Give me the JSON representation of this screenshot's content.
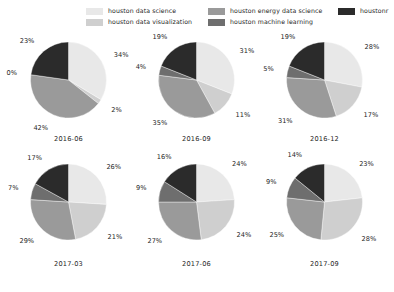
{
  "legend": {
    "entries": [
      {
        "label": "houston data science",
        "color": "#e8e8e8",
        "col": 0,
        "row": 0
      },
      {
        "label": "houston data visualization",
        "color": "#cfcfcf",
        "col": 0,
        "row": 1
      },
      {
        "label": "houston energy data science",
        "color": "#9a9a9a",
        "col": 1,
        "row": 0
      },
      {
        "label": "houston machine learning",
        "color": "#6e6e6e",
        "col": 1,
        "row": 1
      },
      {
        "label": "houstonr",
        "color": "#2b2b2b",
        "col": 2,
        "row": 0
      }
    ]
  },
  "chart_data": {
    "type": "pie",
    "title": "",
    "legend_position": "top",
    "categories": [
      "houston data science",
      "houston data visualization",
      "houston energy data science",
      "houston machine learning",
      "houstonr"
    ],
    "colors": [
      "#e8e8e8",
      "#cfcfcf",
      "#9a9a9a",
      "#6e6e6e",
      "#2b2b2b"
    ],
    "charts": [
      {
        "period": "2016-06",
        "values": [
          34,
          2,
          42,
          0,
          23
        ],
        "labels": [
          "34%",
          "2%",
          "42%",
          "0%",
          "23%"
        ]
      },
      {
        "period": "2016-09",
        "values": [
          31,
          11,
          35,
          4,
          19
        ],
        "labels": [
          "31%",
          "11%",
          "35%",
          "4%",
          "19%"
        ]
      },
      {
        "period": "2016-12",
        "values": [
          28,
          17,
          31,
          5,
          19
        ],
        "labels": [
          "28%",
          "17%",
          "31%",
          "5%",
          "19%"
        ]
      },
      {
        "period": "2017-03",
        "values": [
          26,
          21,
          29,
          7,
          17
        ],
        "labels": [
          "26%",
          "21%",
          "29%",
          "7%",
          "17%"
        ]
      },
      {
        "period": "2017-06",
        "values": [
          24,
          24,
          27,
          9,
          16
        ],
        "labels": [
          "24%",
          "24%",
          "27%",
          "9%",
          "16%"
        ]
      },
      {
        "period": "2017-09",
        "values": [
          23,
          28,
          25,
          9,
          14
        ],
        "labels": [
          "23%",
          "28%",
          "25%",
          "9%",
          "14%"
        ]
      }
    ]
  }
}
